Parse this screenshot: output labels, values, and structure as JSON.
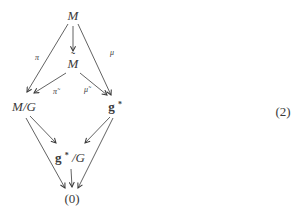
{
  "figure": {
    "type": "commutative-diagram",
    "equation_number": "(2)",
    "ink_color": "#3a3a3a",
    "background_color": "#ffffff",
    "nodes": {
      "M": {
        "label": "M"
      },
      "M_tilde": {
        "base": "M",
        "accent": "˜"
      },
      "M_mod_G": {
        "label": "M/G"
      },
      "g_star": {
        "base": "g",
        "sup": "*"
      },
      "g_star_mod_G": {
        "base": "g",
        "sup": "*",
        "rest": "/G"
      },
      "zero": {
        "label": "(0)"
      }
    },
    "edge_labels": {
      "pi": "π",
      "mu": "μ",
      "pi_tilde": "π̃",
      "mu_tilde": "μ̃"
    },
    "edges": [
      {
        "from": "M",
        "to": "M_tilde",
        "label": ""
      },
      {
        "from": "M",
        "to": "M_mod_G",
        "label": "π"
      },
      {
        "from": "M",
        "to": "g_star",
        "label": "μ"
      },
      {
        "from": "M_tilde",
        "to": "M_mod_G",
        "label": "π̃"
      },
      {
        "from": "M_tilde",
        "to": "g_star",
        "label": "μ̃"
      },
      {
        "from": "M_mod_G",
        "to": "g_star_mod_G",
        "label": ""
      },
      {
        "from": "g_star",
        "to": "g_star_mod_G",
        "label": ""
      },
      {
        "from": "M_mod_G",
        "to": "zero",
        "label": ""
      },
      {
        "from": "g_star",
        "to": "zero",
        "label": ""
      },
      {
        "from": "g_star_mod_G",
        "to": "zero",
        "label": ""
      }
    ]
  }
}
